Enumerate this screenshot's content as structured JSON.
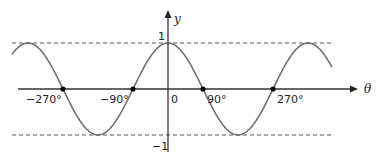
{
  "chart_data": {
    "type": "line",
    "title": "",
    "function": "y = cos(theta)",
    "xlabel": "θ",
    "ylabel": "y",
    "x_range_deg": [
      -400,
      400
    ],
    "ylim": [
      -1,
      1
    ],
    "x_tick_labels": [
      "-270°",
      "-90°",
      "0",
      "90°",
      "270°"
    ],
    "y_tick_labels": [
      "1",
      "-1"
    ],
    "marked_points": [
      {
        "x": -270,
        "y": 0
      },
      {
        "x": -90,
        "y": 0
      },
      {
        "x": 90,
        "y": 0
      },
      {
        "x": 270,
        "y": 0
      }
    ],
    "dashed_lines": [
      {
        "y": 1
      },
      {
        "y": -1
      }
    ],
    "grid": false,
    "legend": null,
    "colors": {
      "curve": "#707070",
      "axes": "#333333",
      "dashed": "#555555",
      "points": "#000000"
    }
  },
  "labels": {
    "y_axis": "y",
    "x_axis": "θ",
    "tick_neg270": "−270°",
    "tick_neg90": "−90°",
    "tick_0": "0",
    "tick_90": "90°",
    "tick_270": "270°",
    "y_one": "1",
    "y_neg_one": "−1"
  }
}
